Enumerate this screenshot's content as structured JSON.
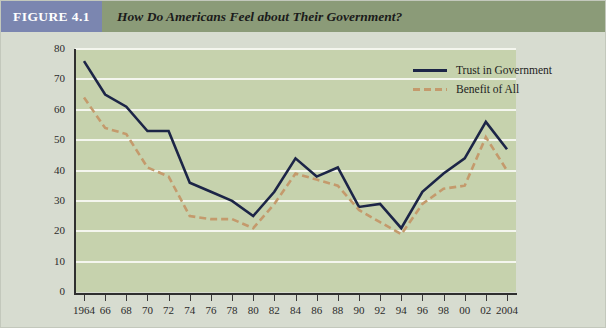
{
  "header": {
    "figure_badge": "FIGURE 4.1",
    "title": "How Do Americans Feel about Their Government?"
  },
  "colors": {
    "badge_bg": "#7b86b0",
    "header_bg": "#8b9b78",
    "page_bg": "#d7dcd0",
    "plot_bg": "#c6d2ad",
    "gridline": "#f4f6ee",
    "trust_line": "#1c2547",
    "benefit_line": "#c49a6c",
    "axis": "#2f2f2f",
    "text": "#1d1d1d"
  },
  "legend": {
    "position": "top-right",
    "items": [
      {
        "label": "Trust in Government",
        "style": "solid",
        "color": "#1c2547"
      },
      {
        "label": "Benefit of All",
        "style": "dashed",
        "color": "#c49a6c"
      }
    ]
  },
  "chart_data": {
    "type": "line",
    "title": "How Do Americans Feel about Their Government?",
    "xlabel": "",
    "ylabel": "",
    "grid": true,
    "legend_position": "top-right",
    "xlim": [
      1964,
      2004
    ],
    "ylim": [
      0,
      80
    ],
    "ytick_labels": [
      "80",
      "70",
      "60",
      "50",
      "40",
      "30",
      "20",
      "10",
      "0"
    ],
    "ytick_values": [
      80,
      70,
      60,
      50,
      40,
      30,
      20,
      10,
      0
    ],
    "x": [
      1964,
      1966,
      1968,
      1970,
      1972,
      1974,
      1976,
      1978,
      1980,
      1982,
      1984,
      1986,
      1988,
      1990,
      1992,
      1994,
      1996,
      1998,
      2000,
      2002,
      2004
    ],
    "xtick_labels": [
      "1964",
      "66",
      "68",
      "70",
      "72",
      "74",
      "76",
      "78",
      "80",
      "82",
      "84",
      "86",
      "88",
      "90",
      "92",
      "94",
      "96",
      "98",
      "00",
      "02",
      "2004"
    ],
    "series": [
      {
        "name": "Trust in Government",
        "color": "#1c2547",
        "style": "solid",
        "values": [
          76,
          65,
          61,
          53,
          53,
          36,
          33,
          30,
          25,
          33,
          44,
          38,
          41,
          28,
          29,
          21,
          33,
          39,
          44,
          56,
          47
        ]
      },
      {
        "name": "Benefit of All",
        "color": "#c49a6c",
        "style": "dashed",
        "values": [
          64,
          54,
          52,
          41,
          38,
          25,
          24,
          24,
          21,
          29,
          39,
          37,
          35,
          27,
          23,
          19,
          29,
          34,
          35,
          51,
          40
        ]
      }
    ]
  }
}
